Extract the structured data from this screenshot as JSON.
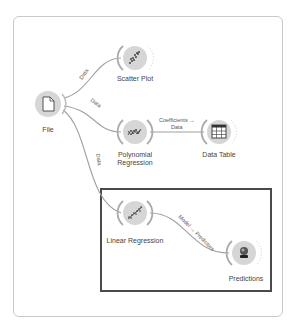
{
  "workflow": {
    "nodes": [
      {
        "id": "file",
        "label": "File",
        "icon": "file-icon"
      },
      {
        "id": "scatter",
        "label": "Scatter Plot",
        "icon": "scatter-plot-icon"
      },
      {
        "id": "poly",
        "label": "Polynomial\nRegression",
        "label_lines": [
          "Polynomial",
          "Regression"
        ],
        "icon": "polynomial-regression-icon"
      },
      {
        "id": "table",
        "label": "Data Table",
        "icon": "data-table-icon"
      },
      {
        "id": "linreg",
        "label": "Linear Regression",
        "icon": "linear-regression-icon"
      },
      {
        "id": "pred",
        "label": "Predictions",
        "icon": "predictions-icon"
      }
    ],
    "links": [
      {
        "from": "file",
        "to": "scatter",
        "label": "Data"
      },
      {
        "from": "file",
        "to": "poly",
        "label": "Data"
      },
      {
        "from": "file",
        "to": "linreg",
        "label": "Data"
      },
      {
        "from": "poly",
        "to": "table",
        "label_lines": [
          "Coefficients →",
          "Data"
        ]
      },
      {
        "from": "linreg",
        "to": "pred",
        "label": "Model → Predictors"
      }
    ]
  },
  "colors": {
    "node_fill": "#d9d9d9",
    "link": "#9a9a9a",
    "highlight_border": "#4a4a4a",
    "frame_border": "#c9c9c9"
  }
}
